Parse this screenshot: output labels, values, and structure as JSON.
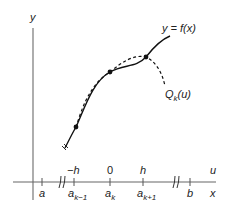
{
  "figure": {
    "axes": {
      "y_label": "y",
      "x_label": "x",
      "u_label": "u"
    },
    "curve_labels": {
      "f": "y = f(x)",
      "q_main": "Q",
      "q_sub": "k",
      "q_arg": "(u)"
    },
    "ticks_upper": [
      {
        "label": "−h"
      },
      {
        "label": "0"
      },
      {
        "label": "h"
      }
    ],
    "ticks_lower": [
      {
        "main": "a",
        "sub": ""
      },
      {
        "main": "a",
        "sub": "k−1"
      },
      {
        "main": "a",
        "sub": "k"
      },
      {
        "main": "a",
        "sub": "k+1"
      },
      {
        "main": "b",
        "sub": ""
      }
    ],
    "colors": {
      "axis": "#555555",
      "curve": "#111111"
    }
  }
}
